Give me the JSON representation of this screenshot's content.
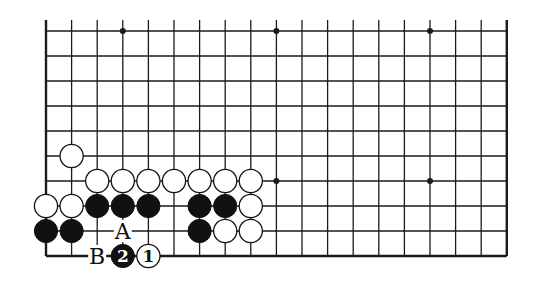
{
  "board": {
    "columns": 19,
    "rows": 10,
    "origin_x": 46,
    "origin_y": 31,
    "spacing_x": 25.6,
    "spacing_y": 25,
    "line_color": "#1a1a1a",
    "edges": {
      "left": true,
      "bottom": true,
      "right": true,
      "top": false
    },
    "star_points": [
      [
        3,
        0
      ],
      [
        9,
        0
      ],
      [
        15,
        0
      ],
      [
        9,
        6
      ],
      [
        15,
        6
      ]
    ]
  },
  "stones": [
    {
      "col": 1,
      "row": 5,
      "color": "white"
    },
    {
      "col": 2,
      "row": 6,
      "color": "white"
    },
    {
      "col": 3,
      "row": 6,
      "color": "white"
    },
    {
      "col": 4,
      "row": 6,
      "color": "white"
    },
    {
      "col": 5,
      "row": 6,
      "color": "white"
    },
    {
      "col": 6,
      "row": 6,
      "color": "white"
    },
    {
      "col": 7,
      "row": 6,
      "color": "white"
    },
    {
      "col": 8,
      "row": 6,
      "color": "white"
    },
    {
      "col": 0,
      "row": 7,
      "color": "white"
    },
    {
      "col": 1,
      "row": 7,
      "color": "white"
    },
    {
      "col": 2,
      "row": 7,
      "color": "black"
    },
    {
      "col": 3,
      "row": 7,
      "color": "black"
    },
    {
      "col": 4,
      "row": 7,
      "color": "black"
    },
    {
      "col": 6,
      "row": 7,
      "color": "black"
    },
    {
      "col": 7,
      "row": 7,
      "color": "black"
    },
    {
      "col": 8,
      "row": 7,
      "color": "white"
    },
    {
      "col": 0,
      "row": 8,
      "color": "black"
    },
    {
      "col": 1,
      "row": 8,
      "color": "black"
    },
    {
      "col": 6,
      "row": 8,
      "color": "black"
    },
    {
      "col": 7,
      "row": 8,
      "color": "white"
    },
    {
      "col": 8,
      "row": 8,
      "color": "white"
    },
    {
      "col": 3,
      "row": 9,
      "color": "black",
      "label": "2"
    },
    {
      "col": 4,
      "row": 9,
      "color": "white",
      "label": "1"
    }
  ],
  "labels": [
    {
      "col": 3,
      "row": 8,
      "text": "A"
    },
    {
      "col": 2,
      "row": 9,
      "text": "B"
    }
  ]
}
